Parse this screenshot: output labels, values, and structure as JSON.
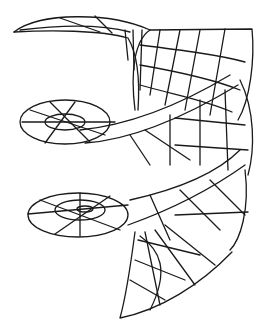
{
  "figure": {
    "background": "#ffffff",
    "stroke": "#1a1a1a",
    "turns": 3
  }
}
